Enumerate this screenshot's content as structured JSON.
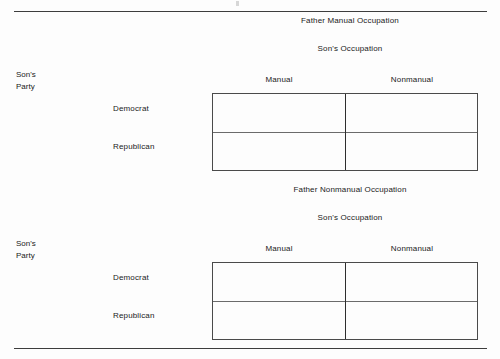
{
  "document": {
    "background_color": "#fdfdfd",
    "text_color": "#1a1a1a",
    "rule_color": "#3d3d3d",
    "grid_border_color": "#4a4a4a"
  },
  "rules": {
    "top_label": "top-horizontal-rule",
    "bottom_label": "bottom-horizontal-rule"
  },
  "panels": [
    {
      "title": "Father Manual Occupation",
      "subtitle": "Son's Occupation",
      "corner_label_line1": "Son's",
      "corner_label_line2": "Party",
      "column_headers": [
        "Manual",
        "Nonmanual"
      ],
      "row_labels": [
        "Democrat",
        "Republican"
      ],
      "cells": [
        [
          "",
          ""
        ],
        [
          "",
          ""
        ]
      ]
    },
    {
      "title": "Father Nonmanual Occupation",
      "subtitle": "Son's Occupation",
      "corner_label_line1": "Son's",
      "corner_label_line2": "Party",
      "column_headers": [
        "Manual",
        "Nonmanual"
      ],
      "row_labels": [
        "Democrat",
        "Republican"
      ],
      "cells": [
        [
          "",
          ""
        ],
        [
          "",
          ""
        ]
      ]
    }
  ]
}
